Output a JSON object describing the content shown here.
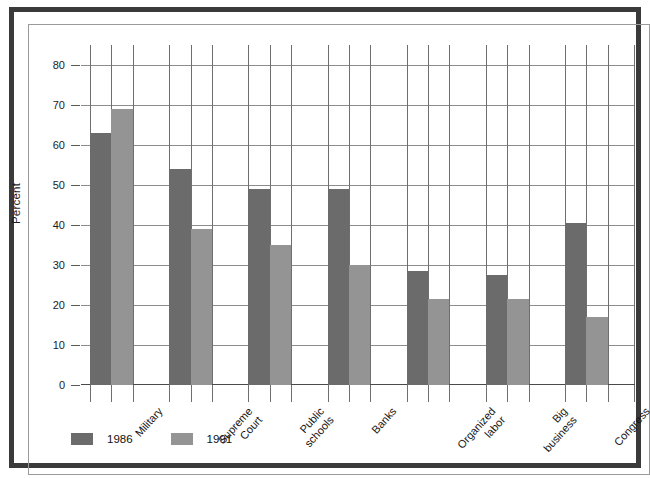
{
  "chart_data": {
    "type": "bar",
    "title": "",
    "xlabel": "",
    "ylabel": "Percent",
    "ylim": [
      0,
      85
    ],
    "yticks": [
      0,
      10,
      20,
      30,
      40,
      50,
      60,
      70,
      80
    ],
    "ytick_labels": [
      "0",
      "10",
      "20",
      "30",
      "40",
      "50",
      "60",
      "70",
      "80"
    ],
    "grid": true,
    "legend_position": "bottom-left",
    "categories": [
      "Military",
      "Supreme Court",
      "Public schools",
      "Banks",
      "Organized labor",
      "Big business",
      "Congress"
    ],
    "category_lines": [
      [
        "Military"
      ],
      [
        "Supreme",
        "Court"
      ],
      [
        "Public",
        "schools"
      ],
      [
        "Banks"
      ],
      [
        "Organized",
        "labor"
      ],
      [
        "Big",
        "business"
      ],
      [
        "Congress"
      ]
    ],
    "series": [
      {
        "name": "1986",
        "color": "#6b6b6b",
        "values": [
          63,
          54,
          49,
          49,
          28.5,
          27.5,
          40.5
        ]
      },
      {
        "name": "1991",
        "color": "#949494",
        "values": [
          69,
          39,
          35,
          30,
          21.5,
          21.5,
          17
        ]
      }
    ]
  },
  "legend": {
    "items": [
      {
        "label": "1986",
        "color": "#6b6b6b"
      },
      {
        "label": "1991",
        "color": "#949494"
      }
    ]
  },
  "colors": {
    "frame": "#3a3a3a",
    "grid": "#8d8d8d",
    "axis": "#4a4a4a",
    "background": "#ffffff",
    "series_1986": "#6b6b6b",
    "series_1991": "#949494"
  }
}
